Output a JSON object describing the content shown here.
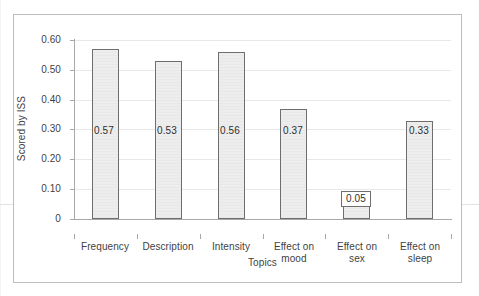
{
  "chart_data": {
    "type": "bar",
    "title": "",
    "xlabel": "Topics",
    "ylabel": "Scored by ISS",
    "categories": [
      "Frequency",
      "Description",
      "Intensity",
      "Effect on mood",
      "Effect on sex",
      "Effect on sleep"
    ],
    "category_lines": [
      [
        "Frequency"
      ],
      [
        "Description"
      ],
      [
        "Intensity"
      ],
      [
        "Effect on",
        "mood"
      ],
      [
        "Effect on",
        "sex"
      ],
      [
        "Effect on",
        "sleep"
      ]
    ],
    "values": [
      0.57,
      0.53,
      0.56,
      0.37,
      0.05,
      0.33
    ],
    "value_labels": [
      "0.57",
      "0.53",
      "0.56",
      "0.37",
      "0.05",
      "0.33"
    ],
    "ylim": [
      0,
      0.6
    ],
    "ytick_values": [
      0,
      0.1,
      0.2,
      0.3,
      0.4,
      0.5,
      0.6
    ],
    "ytick_labels": [
      "0",
      "0.10",
      "0.20",
      "0.30",
      "0.40",
      "0.50",
      "0.60"
    ],
    "grid": true,
    "legend": "none",
    "bar_fill": "#ededed",
    "bar_border": "#6e6e6e",
    "axis_color": "#a8a8a8",
    "grid_color": "#e8e8e8",
    "frame_color": "#bdbdbd",
    "text_color": "#3f3f3f"
  }
}
